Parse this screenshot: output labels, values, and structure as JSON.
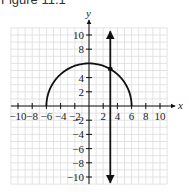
{
  "figure": {
    "title": "Figure 11.1"
  },
  "chart_data": {
    "type": "line",
    "title": "Figure 11.1",
    "xlabel": "x",
    "ylabel": "y",
    "xlim": [
      -11,
      11
    ],
    "ylim": [
      -11,
      11
    ],
    "grid": true,
    "x_ticks": [
      -10,
      -8,
      -6,
      -4,
      -2,
      2,
      4,
      6,
      8,
      10
    ],
    "y_ticks": [
      -10,
      -8,
      -6,
      -4,
      -2,
      2,
      4,
      8,
      10
    ],
    "x_tick_labels": [
      "-10",
      "-8",
      "-6",
      "-4",
      "-2",
      "2",
      "4",
      "6",
      "8",
      "10"
    ],
    "y_tick_labels": [
      "10",
      "8",
      "4",
      "2",
      "-2",
      "-4",
      "-6",
      "-8",
      "-10"
    ],
    "series": [
      {
        "name": "upper semicircle y = sqrt(36 - x^2)",
        "kind": "curve",
        "x": [
          -6,
          -5,
          -4,
          -3,
          -2,
          -1,
          0,
          1,
          2,
          3,
          4,
          5,
          6
        ],
        "y": [
          0,
          3.32,
          4.47,
          5.2,
          5.66,
          5.92,
          6,
          5.92,
          5.66,
          5.2,
          4.47,
          3.32,
          0
        ]
      },
      {
        "name": "vertical line x = 3",
        "kind": "line",
        "x": [
          3,
          3
        ],
        "y": [
          -11,
          11
        ],
        "arrows": "both"
      }
    ],
    "points": [
      {
        "label": "intersection",
        "x": 3,
        "y": 5.2
      }
    ]
  }
}
